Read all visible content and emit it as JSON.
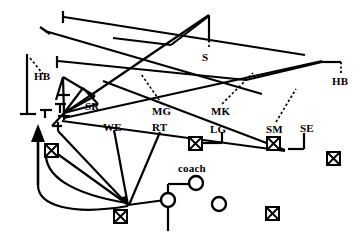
{
  "diagram": {
    "type": "play-diagram",
    "stroke_color": "#000000",
    "background_color": "#ffffff",
    "labels": [
      {
        "id": "hb-left",
        "text": "HB",
        "x": 34,
        "y": 76,
        "size": "normal"
      },
      {
        "id": "hb-right",
        "text": "HB",
        "x": 332,
        "y": 81,
        "size": "normal"
      },
      {
        "id": "s",
        "text": "S",
        "x": 202,
        "y": 57,
        "size": "normal"
      },
      {
        "id": "sr",
        "text": "SR",
        "x": 85,
        "y": 106,
        "size": "normal"
      },
      {
        "id": "mg",
        "text": "MG",
        "x": 152,
        "y": 111,
        "size": "normal"
      },
      {
        "id": "mk",
        "text": "MK",
        "x": 211,
        "y": 111,
        "size": "normal"
      },
      {
        "id": "we",
        "text": "WE",
        "x": 103,
        "y": 127,
        "size": "normal"
      },
      {
        "id": "rt",
        "text": "RT",
        "x": 152,
        "y": 127,
        "size": "normal"
      },
      {
        "id": "lg",
        "text": "LG",
        "x": 210,
        "y": 129,
        "size": "normal"
      },
      {
        "id": "sm",
        "text": "SM",
        "x": 266,
        "y": 129,
        "size": "normal"
      },
      {
        "id": "se",
        "text": "SE",
        "x": 300,
        "y": 128,
        "size": "normal"
      },
      {
        "id": "coach",
        "text": "coach",
        "x": 178,
        "y": 168,
        "size": "normal"
      }
    ],
    "markers": {
      "crossed_boxes": [
        {
          "id": "box-left-upper",
          "x": 51,
          "y": 150
        },
        {
          "id": "box-bottom-left",
          "x": 120,
          "y": 216
        },
        {
          "id": "box-lg",
          "x": 195,
          "y": 143
        },
        {
          "id": "box-sm",
          "x": 273,
          "y": 143
        },
        {
          "id": "box-right",
          "x": 333,
          "y": 158
        },
        {
          "id": "box-bottom-right",
          "x": 272,
          "y": 213
        }
      ],
      "circles": [
        {
          "id": "circle-coach",
          "x": 196,
          "y": 183,
          "r": 7
        },
        {
          "id": "circle-ball",
          "x": 168,
          "y": 200,
          "r": 7
        },
        {
          "id": "circle-right",
          "x": 219,
          "y": 204,
          "r": 7
        }
      ],
      "arrow": {
        "id": "arrow-up",
        "x": 38,
        "y": 135
      }
    }
  }
}
